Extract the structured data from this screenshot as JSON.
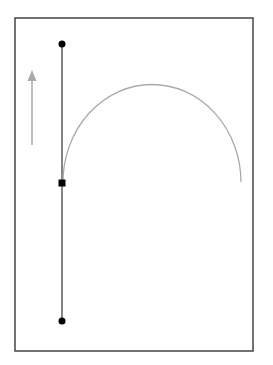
{
  "diagram": {
    "frame": {
      "x": 15,
      "y": 18,
      "width": 238,
      "height": 333,
      "stroke": "#444444"
    },
    "vertical_line": {
      "x": 62,
      "y1": 44,
      "y2": 321,
      "stroke": "#333333"
    },
    "top_point": {
      "cx": 62,
      "cy": 44,
      "r": 3.5,
      "fill": "#000000"
    },
    "bottom_point": {
      "cx": 62,
      "cy": 321,
      "r": 3.5,
      "fill": "#000000"
    },
    "midpoint_square": {
      "cx": 62,
      "cy": 183,
      "size": 7,
      "fill": "#000000"
    },
    "arc": {
      "start_x": 63,
      "start_y": 183,
      "end_x": 241,
      "end_y": 182,
      "peak_y": 85,
      "stroke": "#aaaaaa"
    },
    "direction_arrow": {
      "x": 32,
      "head_y": 70,
      "tail_y": 145,
      "color": "#aaaaaa",
      "direction": "up"
    }
  }
}
